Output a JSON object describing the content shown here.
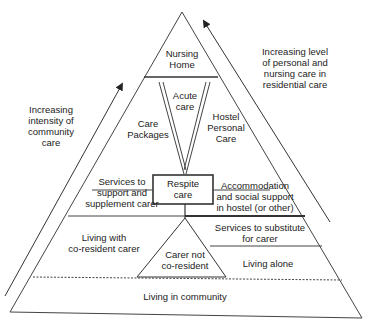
{
  "diagram": {
    "type": "pyramid",
    "annotations": {
      "left_arrow": "Increasing\nintensity of\ncommunity care",
      "right_arrow": "Increasing level\nof personal and\nnursing care in\nresidential care"
    },
    "levels": {
      "nursing_home": "Nursing\nHome",
      "acute_care": "Acute\ncare",
      "care_packages": "Care\nPackages",
      "hostel_personal_care": "Hostel\nPersonal\nCare",
      "respite_care": "Respite\ncare",
      "services_support": "Services to\nsupport and\nsupplement carer",
      "accommodation": "Accommodation\nand social support\nin hostel (or other)",
      "living_with_carer": "Living with\nco-resident carer",
      "services_substitute": "Services to substitute\nfor carer",
      "carer_not_coresident": "Carer not\nco-resident",
      "living_alone": "Living alone",
      "living_in_community": "Living in community"
    },
    "colors": {
      "line": "#333333",
      "background": "#ffffff"
    }
  }
}
